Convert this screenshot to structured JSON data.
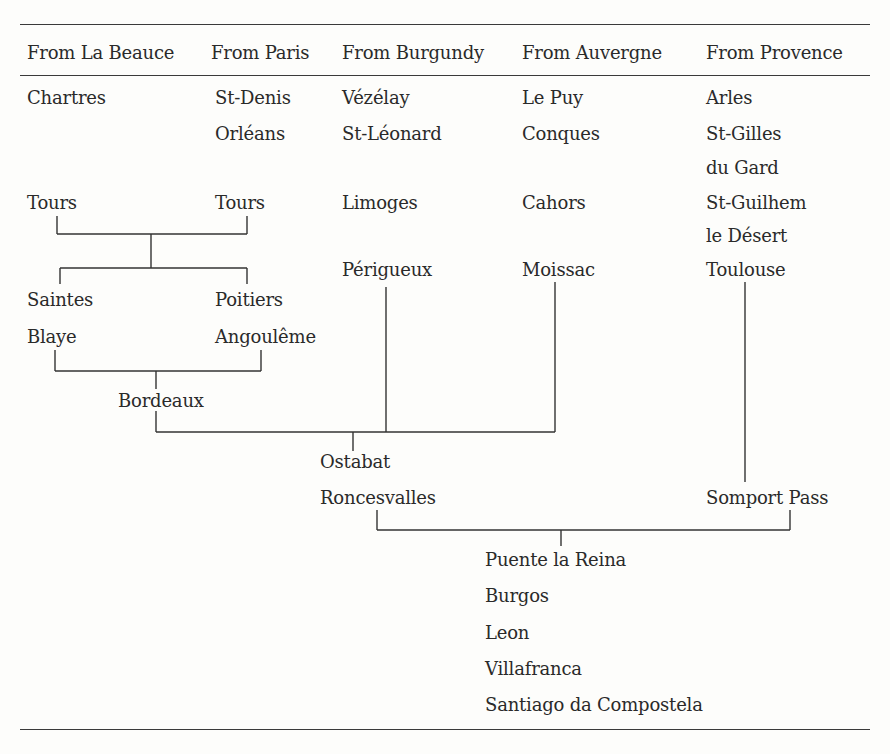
{
  "table": {
    "headers": [
      "From La Beauce",
      "From Paris",
      "From Burgundy",
      "From Auvergne",
      "From Provence"
    ],
    "la_beauce": [
      "Chartres",
      "Tours",
      "Saintes",
      "Blaye"
    ],
    "paris": [
      "St-Denis",
      "Orléans",
      "Tours",
      "Poitiers",
      "Angoulême"
    ],
    "burgundy": [
      "Vézélay",
      "St-Léonard",
      "Limoges",
      "Périgueux"
    ],
    "auvergne": [
      "Le Puy",
      "Conques",
      "Cahors",
      "Moissac"
    ],
    "provence": [
      "Arles",
      "St-Gilles",
      "du Gard",
      "St-Guilhem",
      "le Désert",
      "Toulouse"
    ],
    "junctions": {
      "bordeaux": "Bordeaux",
      "ostabat": "Ostabat",
      "roncesvalles": "Roncesvalles",
      "somport": "Somport Pass"
    },
    "camino": [
      "Puente la Reina",
      "Burgos",
      "Leon",
      "Villafranca",
      "Santiago da Compostela"
    ]
  }
}
